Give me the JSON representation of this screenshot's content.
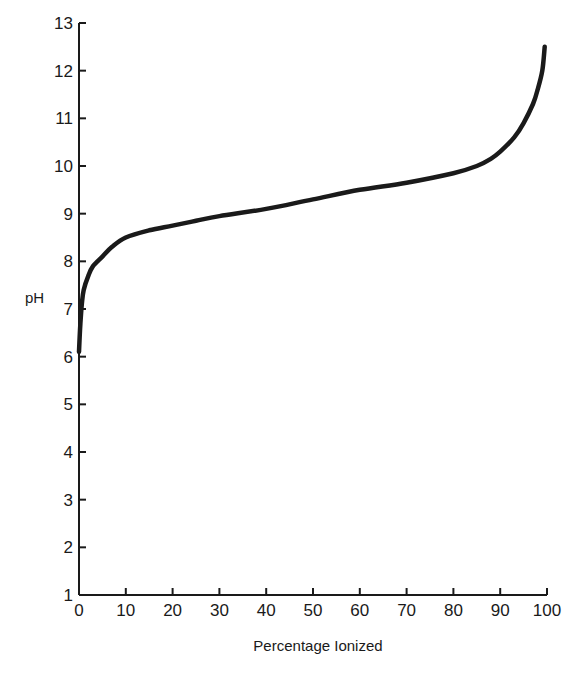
{
  "chart_data": {
    "type": "line",
    "title": "",
    "xlabel": "Percentage Ionized",
    "ylabel": "pH",
    "xlim": [
      0,
      100
    ],
    "ylim": [
      1,
      13
    ],
    "grid": false,
    "legend": null,
    "x_ticks": [
      0,
      10,
      20,
      30,
      40,
      50,
      60,
      70,
      80,
      90,
      100
    ],
    "y_ticks": [
      1,
      2,
      3,
      4,
      5,
      6,
      7,
      8,
      9,
      10,
      11,
      12,
      13
    ],
    "series": [
      {
        "name": "Titration curve",
        "color": "#1a1a1a",
        "x": [
          0,
          0.3,
          0.6,
          1,
          2,
          3,
          5,
          7,
          10,
          15,
          20,
          25,
          30,
          40,
          50,
          60,
          70,
          80,
          85,
          88,
          90,
          93,
          95,
          97,
          98,
          99,
          99.5
        ],
        "y": [
          6.1,
          6.7,
          7.1,
          7.4,
          7.7,
          7.9,
          8.1,
          8.3,
          8.5,
          8.65,
          8.75,
          8.85,
          8.95,
          9.1,
          9.3,
          9.5,
          9.65,
          9.85,
          10.0,
          10.15,
          10.3,
          10.6,
          10.9,
          11.3,
          11.6,
          12.0,
          12.5
        ]
      }
    ]
  },
  "labels": {
    "xlabel": "Percentage Ionized",
    "ylabel": "pH"
  }
}
